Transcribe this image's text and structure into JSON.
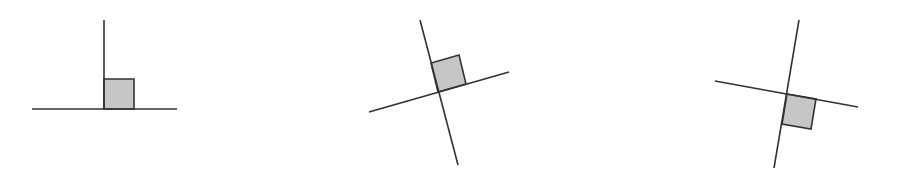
{
  "canvas": {
    "width": 897,
    "height": 180,
    "background": "#ffffff"
  },
  "colors": {
    "line": "#333333",
    "square_fill": "#c6c6c6"
  },
  "figures": [
    {
      "name": "perpendicular-upright",
      "lines": [
        {
          "x1": 104,
          "y1": 20,
          "x2": 104,
          "y2": 109
        },
        {
          "x1": 32,
          "y1": 109,
          "x2": 177,
          "y2": 109
        }
      ],
      "right_angle_marker": "104,109 104,79 134,79 134,109"
    },
    {
      "name": "perpendicular-rotated-ccw",
      "lines": [
        {
          "x1": 420,
          "y1": 20,
          "x2": 458,
          "y2": 165
        },
        {
          "x1": 369,
          "y1": 112,
          "x2": 509,
          "y2": 72
        }
      ],
      "right_angle_marker": "438,92 431,63 459,55 466,84"
    },
    {
      "name": "perpendicular-rotated-cw",
      "lines": [
        {
          "x1": 799,
          "y1": 20,
          "x2": 774,
          "y2": 168
        },
        {
          "x1": 715,
          "y1": 81,
          "x2": 858,
          "y2": 107
        }
      ],
      "right_angle_marker": "787,94 816,99 811,129 782,124"
    }
  ]
}
